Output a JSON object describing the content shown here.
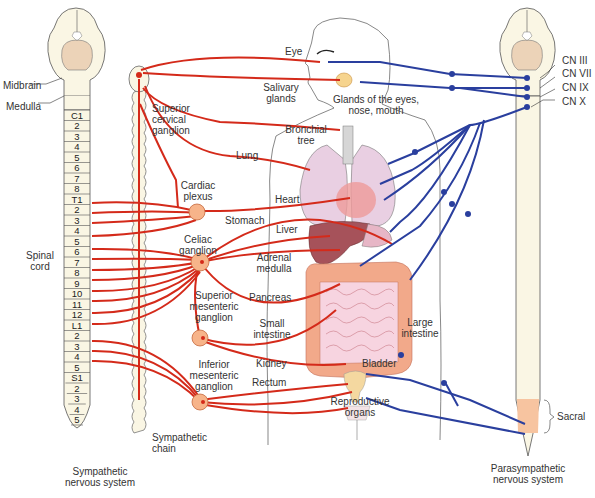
{
  "colors": {
    "sympathetic": "#d42a1a",
    "parasympathetic": "#2a3f9e",
    "cord_fill": "#faf6e4",
    "ganglion_fill": "#f7b48a",
    "sacral_fill": "#f7c4a0",
    "organ_pink": "#e9cfe2",
    "intestine": "#f2a98a",
    "liver": "#a6525a"
  },
  "left_cns": {
    "labels": {
      "midbrain": "Midbrain",
      "medulla": "Medulla",
      "spinal_cord": "Spinal cord"
    },
    "segments": [
      "C1",
      "2",
      "3",
      "4",
      "5",
      "6",
      "7",
      "8",
      "T1",
      "2",
      "3",
      "4",
      "5",
      "6",
      "7",
      "8",
      "9",
      "10",
      "11",
      "12",
      "L1",
      "2",
      "3",
      "4",
      "5",
      "S1",
      "2",
      "3",
      "4",
      "5"
    ],
    "caption": "Sympathetic nervous system"
  },
  "sympathetic_chain": {
    "label": "Sympathetic chain",
    "ganglia": {
      "superior_cervical": "Superior cervical ganglion",
      "cardiac_plexus": "Cardiac plexus",
      "celiac": "Celiac ganglion",
      "superior_mesenteric": "Superior mesenteric ganglion",
      "inferior_mesenteric": "Inferior mesenteric ganglion"
    }
  },
  "organs": {
    "eye": "Eye",
    "salivary": "Salivary glands",
    "glands": "Glands of the eyes, nose, mouth",
    "bronchial": "Bronchial tree",
    "lung": "Lung",
    "heart": "Heart",
    "stomach": "Stomach",
    "liver": "Liver",
    "adrenal": "Adrenal medulla",
    "pancreas": "Pancreas",
    "small_intestine": "Small intestine",
    "large_intestine": "Large intestine",
    "kidney": "Kidney",
    "rectum": "Rectum",
    "bladder": "Bladder",
    "reproductive": "Reproductive organs"
  },
  "right_cns": {
    "cranial_nerves": [
      "CN III",
      "CN VII",
      "CN IX",
      "CN X"
    ],
    "sacral": "Sacral",
    "caption": "Parasympathetic nervous system"
  }
}
